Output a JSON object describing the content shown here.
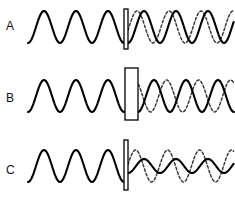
{
  "figure": {
    "width": 235,
    "height": 202,
    "background_color": "#ffffff",
    "solid_color": "#000000",
    "dashed_color": "#3a3a3a",
    "barrier_fill": "#ffffff",
    "barrier_stroke": "#000000"
  },
  "chart_data": {
    "type": "line",
    "xlabel": "",
    "ylabel": "",
    "grid": false,
    "legend": "none",
    "panels": [
      {
        "label": "A",
        "label_x": 6,
        "label_y": 28,
        "baseline_y": 27,
        "incident": {
          "name": "incident-wave",
          "style": "solid",
          "x_start": 28,
          "x_end": 124,
          "amplitude": 16,
          "wavelength": 32,
          "cycles": 3,
          "phase_deg": 270
        },
        "transmitted_solid": {
          "name": "transmitted-wave",
          "style": "solid",
          "x_start": 128,
          "x_end": 234,
          "amplitude": 16,
          "wavelength": 32,
          "phase_deg": 270,
          "phase_shift_deg": 0
        },
        "transmitted_dashed": {
          "name": "reference-wave",
          "style": "dashed",
          "x_start": 128,
          "x_end": 234,
          "amplitude": 16,
          "wavelength": 32,
          "phase_shift_deg": 78
        },
        "barrier": {
          "name": "barrier-thin",
          "x": 124,
          "y": 9,
          "width": 4,
          "height": 40
        }
      },
      {
        "label": "B",
        "label_x": 6,
        "label_y": 100,
        "baseline_y": 96,
        "incident": {
          "name": "incident-wave",
          "style": "solid",
          "x_start": 28,
          "x_end": 125,
          "amplitude": 16,
          "wavelength": 32,
          "cycles": 3,
          "phase_deg": 270
        },
        "transmitted_solid": {
          "name": "transmitted-wave",
          "style": "solid",
          "x_start": 138,
          "x_end": 234,
          "amplitude": 16,
          "wavelength": 32,
          "phase_deg": 270,
          "phase_shift_deg": 0
        },
        "transmitted_dashed": {
          "name": "reference-wave",
          "style": "dashed",
          "x_start": 132,
          "x_end": 234,
          "amplitude": 16,
          "wavelength": 32,
          "phase_shift_deg": 150
        },
        "barrier": {
          "name": "barrier-thick",
          "x": 125,
          "y": 68,
          "width": 13,
          "height": 52
        }
      },
      {
        "label": "C",
        "label_x": 6,
        "label_y": 172,
        "baseline_y": 166,
        "incident": {
          "name": "incident-wave",
          "style": "solid",
          "x_start": 28,
          "x_end": 124,
          "amplitude": 16,
          "wavelength": 32,
          "cycles": 3,
          "phase_deg": 270
        },
        "transmitted_solid": {
          "name": "transmitted-wave-attenuated",
          "style": "solid",
          "x_start": 128,
          "x_end": 234,
          "amplitude": 7,
          "wavelength": 32,
          "phase_deg": 270,
          "phase_shift_deg": 0
        },
        "transmitted_dashed": {
          "name": "reference-wave",
          "style": "dashed",
          "x_start": 128,
          "x_end": 234,
          "amplitude": 16,
          "wavelength": 32,
          "phase_shift_deg": 95
        },
        "barrier": {
          "name": "barrier-thin",
          "x": 124,
          "y": 140,
          "width": 4,
          "height": 50
        }
      }
    ]
  }
}
